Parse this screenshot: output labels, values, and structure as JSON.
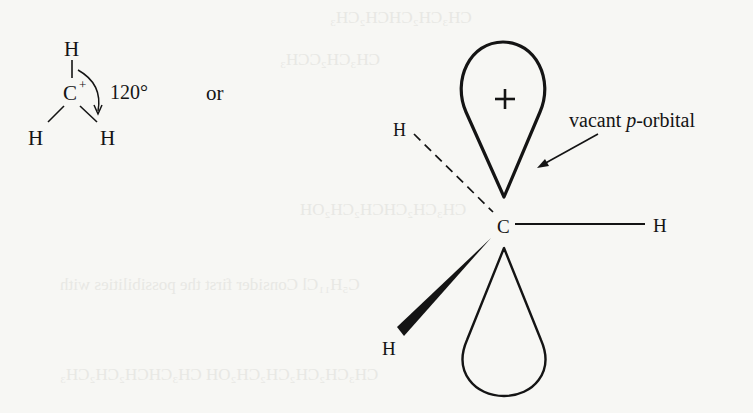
{
  "diagram": {
    "type": "chemistry-structure",
    "colors": {
      "background": "#f7f7f4",
      "ink": "#141414"
    },
    "left_structure": {
      "central_atom": "C",
      "charge": "+",
      "substituents": [
        "H",
        "H",
        "H"
      ],
      "bond_angle_label": "120°",
      "arrow": "curved-angle-arrow"
    },
    "connector_text": "or",
    "right_structure": {
      "central_atom": "C",
      "substituents": {
        "upper_left": "H",
        "right": "H",
        "lower_left": "H"
      },
      "bond_types": {
        "upper_left": "dashed (behind plane)",
        "right": "plain (in plane)",
        "lower_left": "wedge (toward viewer)"
      },
      "upper_lobe_sign": "+",
      "annotation": {
        "prefix": "vacant ",
        "italic": "p",
        "suffix": "-orbital"
      }
    }
  }
}
